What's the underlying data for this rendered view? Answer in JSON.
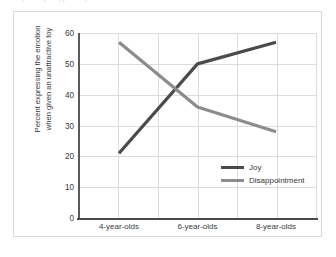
{
  "top_clipped_caption": "partially cropped caption line",
  "chart_data": {
    "type": "line",
    "title": "",
    "xlabel": "",
    "ylabel": "Percent expressing the emotion when given an unattractive toy",
    "ylabel_lines": [
      "Percent expressing the emotion",
      "when given an unattractive toy"
    ],
    "categories": [
      "4-year-olds",
      "6-year-olds",
      "8-year-olds"
    ],
    "series": [
      {
        "name": "Joy",
        "values": [
          21,
          50,
          57
        ],
        "color": "#4a4a4a"
      },
      {
        "name": "Disappointment",
        "values": [
          57,
          36,
          28
        ],
        "color": "#8c8c8c"
      }
    ],
    "ylim": [
      0,
      60
    ],
    "ytick_labels": [
      "0",
      "10",
      "20",
      "30",
      "40",
      "50",
      "60"
    ],
    "ytick_values": [
      0,
      10,
      20,
      30,
      40,
      50,
      60
    ],
    "grid": true,
    "grid_color": "#dcdcdc",
    "vertical_gridline_count": 6,
    "legend_position": "inside-lower-right",
    "legend": [
      {
        "label": "Joy",
        "color": "#4a4a4a"
      },
      {
        "label": "Disappointment",
        "color": "#8c8c8c"
      }
    ]
  }
}
